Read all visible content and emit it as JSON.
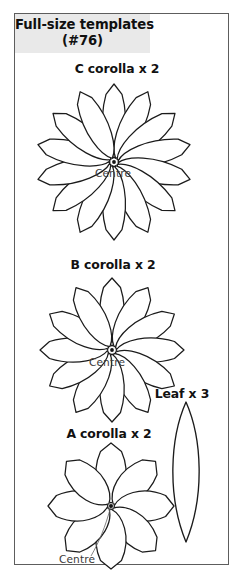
{
  "page": {
    "background_color": "#ffffff",
    "frame_border_color": "#5d5d5d"
  },
  "header": {
    "band_color": "#e9e9e9",
    "title_line1": "Full-size templates",
    "title_line2": "(#76)"
  },
  "sections": [
    {
      "id": "c-corolla",
      "caption": "C corolla x 2",
      "shape": "flower",
      "petal_count": 14,
      "petal_style": "narrow-pointed",
      "centre_label": "Centre",
      "centre_marker": "dot",
      "leader_line": false
    },
    {
      "id": "b-corolla",
      "caption": "B corolla x 2",
      "shape": "flower",
      "petal_count": 12,
      "petal_style": "narrow-pointed",
      "centre_label": "Centre",
      "centre_marker": "dot",
      "leader_line": false
    },
    {
      "id": "a-corolla",
      "caption": "A corolla x 2",
      "shape": "flower",
      "petal_count": 8,
      "petal_style": "broad-pointed",
      "centre_label": "Centre",
      "centre_marker": "dot",
      "leader_line": true
    },
    {
      "id": "leaf",
      "caption": "Leaf x 3",
      "shape": "leaf",
      "petal_count": 1,
      "petal_style": "lens",
      "centre_label": null,
      "centre_marker": null,
      "leader_line": false
    }
  ],
  "colors": {
    "outline": "#1b1b1b",
    "text": "#111111",
    "centre_text": "#3a3a3a",
    "leader": "#6e6e6e"
  }
}
